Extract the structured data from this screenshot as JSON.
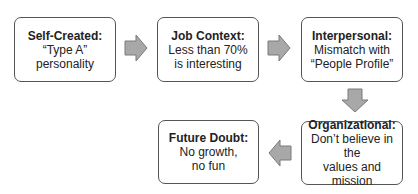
{
  "diagram": {
    "type": "flow",
    "boxes": [
      {
        "title": "Self-Created:",
        "lines": [
          "“Type A”",
          "personality"
        ]
      },
      {
        "title": "Job Context:",
        "lines": [
          "Less than 70%",
          "is interesting"
        ]
      },
      {
        "title": "Interpersonal:",
        "lines": [
          "Mismatch with",
          "“People Profile”"
        ]
      },
      {
        "title": "Organizational:",
        "lines": [
          "Don’t believe in the",
          "values and mission"
        ]
      },
      {
        "title": "Future Doubt:",
        "lines": [
          "No growth,",
          "no fun"
        ]
      }
    ],
    "arrows": [
      "right",
      "right",
      "down",
      "left"
    ],
    "colors": {
      "arrow_fill": "#a8a8a8",
      "arrow_stroke": "#7a7a7a",
      "box_border": "#555555"
    }
  }
}
